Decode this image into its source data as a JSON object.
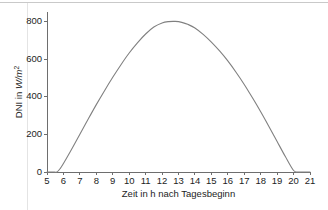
{
  "chart_data": {
    "type": "line",
    "title": "",
    "subtitle": "",
    "xlabel": "Zeit in h nach Tagesbeginn",
    "ylabel_prefix": "DNI in ",
    "ylabel_unit": "W/m",
    "ylabel_exponent": "2",
    "ylabel_full": "DNI in W/m2",
    "xlim": [
      5,
      21
    ],
    "ylim": [
      0,
      850
    ],
    "grid": false,
    "legend": null,
    "line_color": "#808080",
    "axis_color": "#6e6e6e",
    "xticks": [
      5,
      6,
      7,
      8,
      9,
      10,
      11,
      12,
      13,
      14,
      15,
      16,
      17,
      18,
      19,
      20,
      21
    ],
    "xtick_labels": [
      "5",
      "6",
      "7",
      "8",
      "9",
      "10",
      "11",
      "12",
      "13",
      "14",
      "15",
      "16",
      "17",
      "18",
      "19",
      "20",
      "21"
    ],
    "yticks": [
      0,
      200,
      400,
      600,
      800
    ],
    "ytick_labels": [
      "0",
      "200",
      "400",
      "600",
      "800"
    ],
    "series": [
      {
        "name": "DNI",
        "x": [
          5.0,
          5.2,
          5.4,
          5.6,
          5.8,
          6.0,
          6.3,
          6.6,
          7.0,
          7.5,
          8.0,
          8.5,
          9.0,
          9.5,
          10.0,
          10.5,
          11.0,
          11.5,
          12.0,
          12.4,
          12.8,
          13.2,
          13.6,
          14.0,
          14.5,
          15.0,
          15.5,
          16.0,
          16.5,
          17.0,
          17.5,
          18.0,
          18.5,
          19.0,
          19.5,
          20.0,
          20.3,
          20.6,
          21.0
        ],
        "y": [
          0,
          0,
          0,
          0,
          18,
          45,
          90,
          137,
          200,
          280,
          358,
          432,
          503,
          570,
          632,
          686,
          733,
          770,
          792,
          799,
          800,
          795,
          783,
          765,
          731,
          690,
          643,
          590,
          530,
          465,
          394,
          320,
          242,
          162,
          82,
          8,
          0,
          0,
          0
        ]
      }
    ]
  },
  "plot_geometry": {
    "left": 47,
    "right": 310,
    "top": 12,
    "bottom": 172
  }
}
